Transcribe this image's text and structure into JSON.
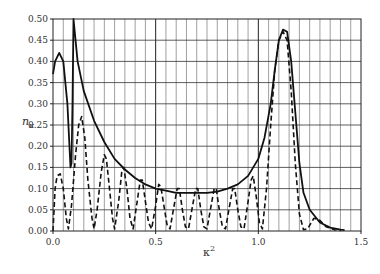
{
  "chart_data": {
    "type": "line",
    "title": "",
    "xlabel": "κ²",
    "ylabel": "n_κ",
    "xlim": [
      0.0,
      1.5
    ],
    "ylim": [
      0.0,
      0.5
    ],
    "x_ticks": [
      "0.0",
      "0.5",
      "1.0",
      "1.5"
    ],
    "y_ticks": [
      "0.00",
      "0.05",
      "0.10",
      "0.15",
      "0.20",
      "0.25",
      "0.30",
      "0.35",
      "0.40",
      "0.45",
      "0.50"
    ],
    "grid": true,
    "legend": null,
    "series": [
      {
        "name": "envelope (solid)",
        "style": "solid",
        "points": [
          [
            0.0,
            0.37
          ],
          [
            0.01,
            0.4
          ],
          [
            0.03,
            0.42
          ],
          [
            0.05,
            0.4
          ],
          [
            0.07,
            0.3
          ],
          [
            0.085,
            0.15
          ],
          [
            0.09,
            0.16
          ],
          [
            0.095,
            0.3
          ],
          [
            0.1,
            0.5
          ],
          [
            0.12,
            0.4
          ],
          [
            0.15,
            0.33
          ],
          [
            0.2,
            0.26
          ],
          [
            0.25,
            0.21
          ],
          [
            0.3,
            0.17
          ],
          [
            0.35,
            0.145
          ],
          [
            0.4,
            0.125
          ],
          [
            0.45,
            0.11
          ],
          [
            0.5,
            0.1
          ],
          [
            0.55,
            0.095
          ],
          [
            0.6,
            0.09
          ],
          [
            0.65,
            0.09
          ],
          [
            0.7,
            0.09
          ],
          [
            0.75,
            0.09
          ],
          [
            0.8,
            0.093
          ],
          [
            0.85,
            0.1
          ],
          [
            0.9,
            0.11
          ],
          [
            0.95,
            0.13
          ],
          [
            1.0,
            0.17
          ],
          [
            1.03,
            0.22
          ],
          [
            1.06,
            0.3
          ],
          [
            1.08,
            0.38
          ],
          [
            1.1,
            0.45
          ],
          [
            1.12,
            0.475
          ],
          [
            1.14,
            0.47
          ],
          [
            1.16,
            0.4
          ],
          [
            1.18,
            0.28
          ],
          [
            1.2,
            0.16
          ],
          [
            1.22,
            0.09
          ],
          [
            1.25,
            0.05
          ],
          [
            1.3,
            0.02
          ],
          [
            1.35,
            0.008
          ],
          [
            1.4,
            0.003
          ],
          [
            1.42,
            0.002
          ]
        ]
      },
      {
        "name": "oscillating (dashed)",
        "style": "dashed",
        "points": [
          [
            0.0,
            0.0
          ],
          [
            0.01,
            0.1
          ],
          [
            0.02,
            0.13
          ],
          [
            0.035,
            0.135
          ],
          [
            0.05,
            0.1
          ],
          [
            0.065,
            0.03
          ],
          [
            0.075,
            0.005
          ],
          [
            0.09,
            0.06
          ],
          [
            0.11,
            0.18
          ],
          [
            0.125,
            0.25
          ],
          [
            0.14,
            0.27
          ],
          [
            0.155,
            0.22
          ],
          [
            0.17,
            0.12
          ],
          [
            0.19,
            0.03
          ],
          [
            0.2,
            0.005
          ],
          [
            0.215,
            0.05
          ],
          [
            0.235,
            0.14
          ],
          [
            0.25,
            0.18
          ],
          [
            0.26,
            0.17
          ],
          [
            0.275,
            0.1
          ],
          [
            0.29,
            0.03
          ],
          [
            0.3,
            0.005
          ],
          [
            0.32,
            0.07
          ],
          [
            0.335,
            0.14
          ],
          [
            0.345,
            0.15
          ],
          [
            0.36,
            0.1
          ],
          [
            0.375,
            0.03
          ],
          [
            0.39,
            0.005
          ],
          [
            0.41,
            0.07
          ],
          [
            0.425,
            0.12
          ],
          [
            0.435,
            0.12
          ],
          [
            0.45,
            0.07
          ],
          [
            0.465,
            0.02
          ],
          [
            0.48,
            0.005
          ],
          [
            0.5,
            0.06
          ],
          [
            0.515,
            0.11
          ],
          [
            0.525,
            0.105
          ],
          [
            0.54,
            0.06
          ],
          [
            0.555,
            0.015
          ],
          [
            0.57,
            0.005
          ],
          [
            0.59,
            0.06
          ],
          [
            0.605,
            0.1
          ],
          [
            0.615,
            0.1
          ],
          [
            0.63,
            0.05
          ],
          [
            0.645,
            0.01
          ],
          [
            0.66,
            0.005
          ],
          [
            0.68,
            0.06
          ],
          [
            0.695,
            0.1
          ],
          [
            0.705,
            0.1
          ],
          [
            0.72,
            0.05
          ],
          [
            0.735,
            0.01
          ],
          [
            0.75,
            0.005
          ],
          [
            0.77,
            0.06
          ],
          [
            0.785,
            0.1
          ],
          [
            0.795,
            0.1
          ],
          [
            0.81,
            0.05
          ],
          [
            0.825,
            0.01
          ],
          [
            0.84,
            0.005
          ],
          [
            0.86,
            0.06
          ],
          [
            0.875,
            0.1
          ],
          [
            0.885,
            0.1
          ],
          [
            0.9,
            0.05
          ],
          [
            0.915,
            0.01
          ],
          [
            0.93,
            0.005
          ],
          [
            0.95,
            0.07
          ],
          [
            0.965,
            0.12
          ],
          [
            0.975,
            0.13
          ],
          [
            0.99,
            0.08
          ],
          [
            1.005,
            0.02
          ],
          [
            1.02,
            0.005
          ],
          [
            1.04,
            0.1
          ],
          [
            1.06,
            0.25
          ],
          [
            1.08,
            0.38
          ],
          [
            1.1,
            0.45
          ],
          [
            1.12,
            0.47
          ],
          [
            1.14,
            0.45
          ],
          [
            1.16,
            0.33
          ],
          [
            1.18,
            0.16
          ],
          [
            1.2,
            0.04
          ],
          [
            1.22,
            0.003
          ],
          [
            1.24,
            0.005
          ],
          [
            1.27,
            0.03
          ],
          [
            1.3,
            0.025
          ],
          [
            1.33,
            0.01
          ],
          [
            1.37,
            0.003
          ],
          [
            1.4,
            0.001
          ]
        ]
      }
    ]
  }
}
